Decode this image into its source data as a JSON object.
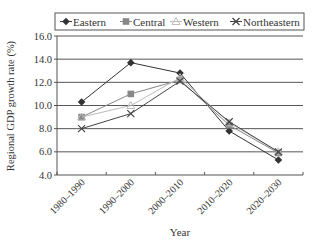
{
  "chart_data": {
    "type": "line",
    "title": "",
    "xlabel": "Year",
    "ylabel": "Regional GDP growth rate (%)",
    "categories": [
      "1980–1990",
      "1990–2000",
      "2000–2010",
      "2010–2020",
      "2020–2030"
    ],
    "ylim": [
      4.0,
      16.0
    ],
    "yticks": [
      "4.0",
      "6.0",
      "8.0",
      "10.0",
      "12.0",
      "14.0",
      "16.0"
    ],
    "grid": true,
    "legend_position": "top",
    "series": [
      {
        "name": "Eastern",
        "marker": "diamond",
        "color": "#333333",
        "values": [
          10.3,
          13.7,
          12.8,
          7.8,
          5.3
        ]
      },
      {
        "name": "Central",
        "marker": "square",
        "color": "#888888",
        "values": [
          9.0,
          11.0,
          12.2,
          8.3,
          5.9
        ]
      },
      {
        "name": "Western",
        "marker": "triangle",
        "color": "#bbbbbb",
        "values": [
          9.0,
          10.0,
          12.4,
          8.5,
          6.0
        ]
      },
      {
        "name": "Northeastern",
        "marker": "x",
        "color": "#444444",
        "values": [
          8.0,
          9.3,
          12.1,
          8.6,
          6.0
        ]
      }
    ]
  }
}
